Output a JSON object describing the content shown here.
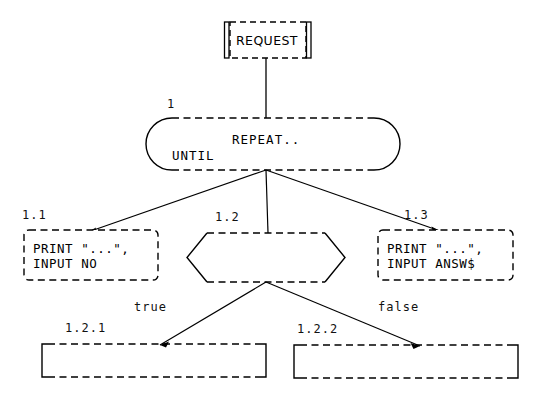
{
  "diagram": {
    "type": "structured-program-flowchart",
    "background_color": "#ffffff",
    "line_color": "#000000",
    "nodes": [
      {
        "id": "request",
        "shape": "subroutine",
        "border": "dashed-with-side-bars",
        "label": "REQUEST",
        "ref": "",
        "x": 224,
        "y": 22,
        "w": 88,
        "h": 36
      },
      {
        "id": "loop",
        "shape": "stadium",
        "border": "dashed-top-bottom-solid-ends",
        "ref": "1",
        "line1": "REPEAT..",
        "line2": "UNTIL",
        "x": 146,
        "y": 118,
        "w": 254,
        "h": 52
      },
      {
        "id": "n11",
        "shape": "rounded-rect",
        "border": "dashed",
        "ref": "1.1",
        "line1": "PRINT \"...\",",
        "line2": "INPUT NO",
        "x": 24,
        "y": 230,
        "w": 134,
        "h": 50
      },
      {
        "id": "n12",
        "shape": "hexagon",
        "border": "dashed-top-bottom-solid-sides",
        "ref": "1.2",
        "line1": "",
        "line2": "",
        "x": 187,
        "y": 233,
        "w": 158,
        "h": 49
      },
      {
        "id": "n13",
        "shape": "rounded-rect",
        "border": "dashed",
        "ref": "1.3",
        "line1": "PRINT \"...\",",
        "line2": "INPUT ANSW$",
        "x": 378,
        "y": 230,
        "w": 135,
        "h": 50
      },
      {
        "id": "n121",
        "shape": "rect",
        "border": "dashed-top-bottom-solid-sides",
        "ref": "1.2.1",
        "line1": "",
        "line2": "",
        "x": 42,
        "y": 344,
        "w": 224,
        "h": 33
      },
      {
        "id": "n122",
        "shape": "rect",
        "border": "dashed-top-bottom-solid-sides",
        "ref": "1.2.2",
        "line1": "",
        "line2": "",
        "x": 294,
        "y": 345,
        "w": 224,
        "h": 33
      }
    ],
    "edges": [
      {
        "id": "e-request-loop",
        "from": "request",
        "to": "loop",
        "label": "",
        "arrow": false
      },
      {
        "id": "e-loop-11",
        "from": "loop",
        "to": "n11",
        "label": "",
        "arrow": true
      },
      {
        "id": "e-loop-12",
        "from": "loop",
        "to": "n12",
        "label": "",
        "arrow": true
      },
      {
        "id": "e-loop-13",
        "from": "loop",
        "to": "n13",
        "label": "",
        "arrow": true
      },
      {
        "id": "e-12-121",
        "from": "n12",
        "to": "n121",
        "label": "true",
        "arrow": true
      },
      {
        "id": "e-12-122",
        "from": "n12",
        "to": "n122",
        "label": "false",
        "arrow": true
      }
    ],
    "refs": {
      "loop": "1",
      "n11": "1.1",
      "n12": "1.2",
      "n13": "1.3",
      "n121": "1.2.1",
      "n122": "1.2.2"
    },
    "texts": {
      "request": "REQUEST",
      "repeat": "REPEAT..",
      "until": "UNTIL",
      "n11_l1": "PRINT \"...\",",
      "n11_l2": "INPUT NO",
      "n13_l1": "PRINT \"...\",",
      "n13_l2": "INPUT ANSW$",
      "true_label": "true",
      "false_label": "false"
    }
  }
}
